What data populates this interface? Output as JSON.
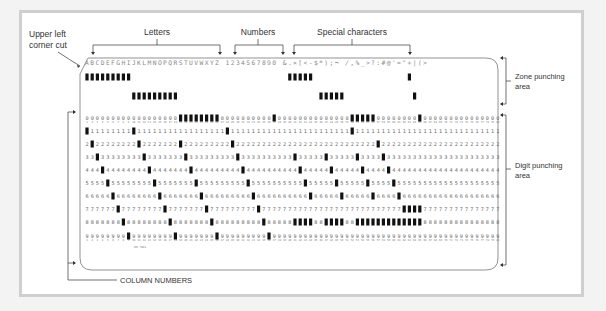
{
  "labels": {
    "corner_cut": [
      "Upper left",
      "corner cut"
    ],
    "letters": "Letters",
    "numbers": "Numbers",
    "special": "Special characters",
    "zone_area": [
      "Zone punching",
      "area"
    ],
    "digit_area": [
      "Digit punching",
      "area"
    ],
    "column_numbers": "COLUMN NUMBERS",
    "card_code": "CDC 5081"
  },
  "card": {
    "columns": 80,
    "printed_header": {
      "letters": "ABCDEFGHIJKLMNOPQRSTUVWXYZ",
      "numbers": "1234567890",
      "special": "&.¤[<-$*);¬ /,%_>?:#@'=\"+|(>"
    },
    "digit_rows": [
      "0",
      "1",
      "2",
      "3",
      "4",
      "5",
      "6",
      "7",
      "8",
      "9"
    ],
    "punches": [
      {
        "col": 1,
        "rows": [
          "12",
          "1"
        ]
      },
      {
        "col": 2,
        "rows": [
          "12",
          "2"
        ]
      },
      {
        "col": 3,
        "rows": [
          "12",
          "3"
        ]
      },
      {
        "col": 4,
        "rows": [
          "12",
          "4"
        ]
      },
      {
        "col": 5,
        "rows": [
          "12",
          "5"
        ]
      },
      {
        "col": 6,
        "rows": [
          "12",
          "6"
        ]
      },
      {
        "col": 7,
        "rows": [
          "12",
          "7"
        ]
      },
      {
        "col": 8,
        "rows": [
          "12",
          "8"
        ]
      },
      {
        "col": 9,
        "rows": [
          "12",
          "9"
        ]
      },
      {
        "col": 10,
        "rows": [
          "11",
          "1"
        ]
      },
      {
        "col": 11,
        "rows": [
          "11",
          "2"
        ]
      },
      {
        "col": 12,
        "rows": [
          "11",
          "3"
        ]
      },
      {
        "col": 13,
        "rows": [
          "11",
          "4"
        ]
      },
      {
        "col": 14,
        "rows": [
          "11",
          "5"
        ]
      },
      {
        "col": 15,
        "rows": [
          "11",
          "6"
        ]
      },
      {
        "col": 16,
        "rows": [
          "11",
          "7"
        ]
      },
      {
        "col": 17,
        "rows": [
          "11",
          "8"
        ]
      },
      {
        "col": 18,
        "rows": [
          "11",
          "9"
        ]
      },
      {
        "col": 19,
        "rows": [
          "0",
          "2"
        ]
      },
      {
        "col": 20,
        "rows": [
          "0",
          "3"
        ]
      },
      {
        "col": 21,
        "rows": [
          "0",
          "4"
        ]
      },
      {
        "col": 22,
        "rows": [
          "0",
          "5"
        ]
      },
      {
        "col": 23,
        "rows": [
          "0",
          "6"
        ]
      },
      {
        "col": 24,
        "rows": [
          "0",
          "7"
        ]
      },
      {
        "col": 25,
        "rows": [
          "0",
          "8"
        ]
      },
      {
        "col": 26,
        "rows": [
          "0",
          "9"
        ]
      },
      {
        "col": 28,
        "rows": [
          "1"
        ]
      },
      {
        "col": 29,
        "rows": [
          "2"
        ]
      },
      {
        "col": 30,
        "rows": [
          "3"
        ]
      },
      {
        "col": 31,
        "rows": [
          "4"
        ]
      },
      {
        "col": 32,
        "rows": [
          "5"
        ]
      },
      {
        "col": 33,
        "rows": [
          "6"
        ]
      },
      {
        "col": 34,
        "rows": [
          "7"
        ]
      },
      {
        "col": 35,
        "rows": [
          "8"
        ]
      },
      {
        "col": 36,
        "rows": [
          "9"
        ]
      },
      {
        "col": 37,
        "rows": [
          "0"
        ]
      },
      {
        "col": 40,
        "rows": [
          "12"
        ]
      },
      {
        "col": 41,
        "rows": [
          "12",
          "3",
          "8"
        ]
      },
      {
        "col": 42,
        "rows": [
          "12",
          "4",
          "8"
        ]
      },
      {
        "col": 43,
        "rows": [
          "12",
          "5",
          "8"
        ]
      },
      {
        "col": 44,
        "rows": [
          "12",
          "6",
          "8"
        ]
      },
      {
        "col": 46,
        "rows": [
          "11"
        ]
      },
      {
        "col": 47,
        "rows": [
          "11",
          "3",
          "8"
        ]
      },
      {
        "col": 48,
        "rows": [
          "11",
          "4",
          "8"
        ]
      },
      {
        "col": 49,
        "rows": [
          "11",
          "5",
          "8"
        ]
      },
      {
        "col": 50,
        "rows": [
          "11",
          "6",
          "8"
        ]
      },
      {
        "col": 52,
        "rows": [
          "0",
          "1"
        ]
      },
      {
        "col": 53,
        "rows": [
          "0",
          "3",
          "8"
        ]
      },
      {
        "col": 54,
        "rows": [
          "0",
          "4",
          "8"
        ]
      },
      {
        "col": 55,
        "rows": [
          "0",
          "5",
          "8"
        ]
      },
      {
        "col": 56,
        "rows": [
          "0",
          "6",
          "8"
        ]
      },
      {
        "col": 57,
        "rows": [
          "2",
          "8"
        ]
      },
      {
        "col": 58,
        "rows": [
          "3",
          "8"
        ]
      },
      {
        "col": 59,
        "rows": [
          "4",
          "8"
        ]
      },
      {
        "col": 60,
        "rows": [
          "5",
          "8"
        ]
      },
      {
        "col": 61,
        "rows": [
          "6",
          "8"
        ]
      },
      {
        "col": 62,
        "rows": [
          "7",
          "8"
        ]
      },
      {
        "col": 63,
        "rows": [
          "12",
          "7",
          "8"
        ]
      },
      {
        "col": 64,
        "rows": [
          "11",
          "7",
          "8"
        ]
      },
      {
        "col": 65,
        "rows": [
          "0",
          "7",
          "8"
        ]
      }
    ]
  }
}
